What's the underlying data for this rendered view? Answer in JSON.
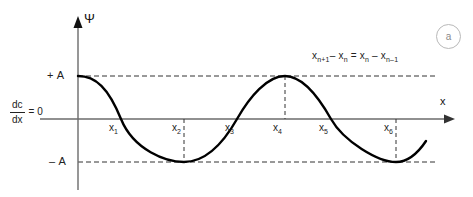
{
  "figure": {
    "panel_label": "a",
    "background_color": "#ffffff",
    "curve_color": "#000000",
    "axis_color": "#6b6b6b",
    "dashed_color": "#333333"
  },
  "axes": {
    "y_axis_label": "Ψ",
    "x_axis_label": "x",
    "zero_level_label": {
      "numerator": "dc",
      "denominator": "dx",
      "equals": "= 0"
    },
    "amplitude_labels": {
      "positive": "+ A",
      "negative": "– A"
    }
  },
  "annotations": {
    "spacing_equation": "xₙ₊₁ – xₙ  =  xₙ – xₙ₋₁",
    "equation_parts": {
      "term1_base": "x",
      "term1_sub": "n+1",
      "minus": "–",
      "term2_base": "x",
      "term2_sub": "n",
      "equals": "=",
      "term3_base": "x",
      "term3_sub": "n",
      "term4_base": "x",
      "term4_sub": "n–1"
    }
  },
  "x_ticks": [
    {
      "label_base": "x",
      "label_sub": "1",
      "x_px": 121,
      "kind": "zero-crossing",
      "has_dashed_drop": false
    },
    {
      "label_base": "x",
      "label_sub": "2",
      "x_px": 184,
      "kind": "minimum",
      "has_dashed_drop": true
    },
    {
      "label_base": "x",
      "label_sub": "3",
      "x_px": 237,
      "kind": "zero-crossing",
      "has_dashed_drop": false
    },
    {
      "label_base": "x",
      "label_sub": "4",
      "x_px": 285,
      "kind": "maximum",
      "has_dashed_drop": true
    },
    {
      "label_base": "x",
      "label_sub": "5",
      "x_px": 331,
      "kind": "zero-crossing",
      "has_dashed_drop": false
    },
    {
      "label_base": "x",
      "label_sub": "6",
      "x_px": 396,
      "kind": "minimum",
      "has_dashed_drop": true
    }
  ],
  "chart_data": {
    "type": "line",
    "title": "",
    "xlabel": "x",
    "ylabel": "Ψ",
    "waveform": "cosine",
    "amplitude": 1,
    "amplitude_labels": [
      "+ A",
      "– A"
    ],
    "period_px": 212,
    "phase": "starts at +A on the y-axis",
    "grid": false,
    "legend": null,
    "ylim": [
      -1,
      1
    ],
    "zero_line_label": "dc/dx = 0",
    "annotation": "x(n+1) - x(n) = x(n) - x(n-1)",
    "x": [
      0,
      1,
      2,
      3,
      4,
      5,
      6,
      7,
      8,
      9,
      10,
      11,
      12
    ],
    "y": [
      1,
      0.5,
      0,
      -0.5,
      -1,
      -0.5,
      0,
      0.5,
      1,
      0.5,
      0,
      -0.5,
      -1
    ],
    "extrema": [
      {
        "name": "x1",
        "type": "zero-crossing",
        "value": 0
      },
      {
        "name": "x2",
        "type": "minimum",
        "value": -1
      },
      {
        "name": "x3",
        "type": "zero-crossing",
        "value": 0
      },
      {
        "name": "x4",
        "type": "maximum",
        "value": 1
      },
      {
        "name": "x5",
        "type": "zero-crossing",
        "value": 0
      },
      {
        "name": "x6",
        "type": "minimum",
        "value": -1
      }
    ]
  }
}
